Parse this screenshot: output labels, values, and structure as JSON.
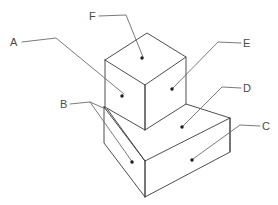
{
  "figure": {
    "background_color": "#ffffff",
    "edge_color": "#3a3a3a",
    "leader_color": "#6b6b6b",
    "dot_color": "#1a1a1a",
    "label_color": "#4a4a4a"
  },
  "labels": [
    {
      "id": "A",
      "text": "A",
      "text_x": 10,
      "text_y": 46,
      "target_face": "cube-left-face",
      "leader_path": "M 22 42 L 56 38 L 124 94",
      "dot_x": 122,
      "dot_y": 96
    },
    {
      "id": "B",
      "text": "B",
      "text_x": 60,
      "text_y": 108,
      "target_face": "base-left-end-face",
      "leader_path": "M 70 104 L 90 102 L 133 163",
      "leader_path_2": "M 90 102 L 108 110",
      "dot_x": 132,
      "dot_y": 162
    },
    {
      "id": "C",
      "text": "C",
      "text_x": 262,
      "text_y": 130,
      "target_face": "base-front-face",
      "leader_path": "M 260 126 L 240 125 L 193 159",
      "dot_x": 192,
      "dot_y": 160
    },
    {
      "id": "D",
      "text": "D",
      "text_x": 243,
      "text_y": 92,
      "target_face": "base-top-face",
      "leader_path": "M 241 88 L 222 87 L 183 126",
      "dot_x": 182,
      "dot_y": 127
    },
    {
      "id": "E",
      "text": "E",
      "text_x": 243,
      "text_y": 47,
      "target_face": "cube-right-face",
      "leader_path": "M 241 43 L 218 42 L 173 88",
      "dot_x": 172,
      "dot_y": 89
    },
    {
      "id": "F",
      "text": "F",
      "text_x": 89,
      "text_y": 20,
      "target_face": "cube-top-face",
      "leader_path": "M 99 16 L 126 15 L 143 57",
      "dot_x": 142,
      "dot_y": 58
    }
  ],
  "geometry": {
    "cube": {
      "top_face": "105,60 147,33 186,57 145,85",
      "left_face": "105,60 145,85 145,130 105,107",
      "right_face": "145,85 186,57 186,104 145,130"
    },
    "base": {
      "top_face": "104,107 145,130 145,130 230,118 186,104 145,130 104,107",
      "top_face_points": "104,107 186,104 230,118 145,161",
      "left_end_face": "104,107 145,161 145,197 104,143",
      "front_face": "145,161 230,118 230,152 145,197",
      "inner_edge": "104,107 145,161"
    }
  }
}
